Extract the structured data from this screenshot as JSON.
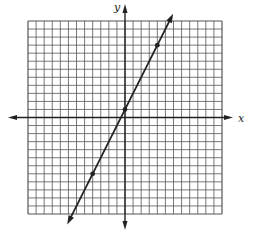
{
  "chart_data": {
    "type": "line",
    "title": "",
    "xlabel": "x",
    "ylabel": "y",
    "grid": true,
    "grid_squares": 24,
    "xlim": [
      -12,
      12
    ],
    "ylim": [
      -12,
      12
    ],
    "legend": null,
    "series": [
      {
        "name": "y = 2x + 1",
        "equation": "y = 2x + 1",
        "slope": 2,
        "intercept": 1,
        "arrowheads": "both",
        "marked_points": [
          {
            "x": -4,
            "y": -7
          },
          {
            "x": 0,
            "y": 1
          },
          {
            "x": 4,
            "y": 9
          }
        ]
      }
    ]
  },
  "colors": {
    "grid": "#555555",
    "axes": "#222222",
    "line": "#222222",
    "background": "#ffffff"
  },
  "labels": {
    "x_axis": "x",
    "y_axis": "y"
  }
}
